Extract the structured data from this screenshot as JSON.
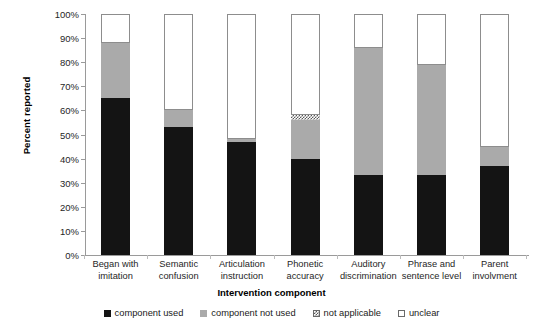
{
  "chart_data": {
    "type": "bar",
    "subtype": "stacked-bar-100-percent",
    "title": "",
    "xlabel": "Intervention component",
    "ylabel": "Percent reported",
    "ylim": [
      0,
      100
    ],
    "ytick_labels": [
      "0%",
      "10%",
      "20%",
      "30%",
      "40%",
      "50%",
      "60%",
      "70%",
      "80%",
      "90%",
      "100%"
    ],
    "ytick_values": [
      0,
      10,
      20,
      30,
      40,
      50,
      60,
      70,
      80,
      90,
      100
    ],
    "grid": false,
    "legend_position": "bottom",
    "categories": [
      "Began with imitation",
      "Semantic confusion",
      "Articulation instruction",
      "Phonetic accuracy",
      "Auditory discrimination",
      "Phrase and sentence level",
      "Parent involvment"
    ],
    "category_lines": [
      [
        "Began with",
        "imitation"
      ],
      [
        "Semantic",
        "confusion"
      ],
      [
        "Articulation",
        "instruction"
      ],
      [
        "Phonetic",
        "accuracy"
      ],
      [
        "Auditory",
        "discrimination"
      ],
      [
        "Phrase and",
        "sentence level"
      ],
      [
        "Parent",
        "involvment"
      ]
    ],
    "series": [
      {
        "name": "component used",
        "color": "#141414",
        "pattern": "solid",
        "values": [
          65,
          53,
          47,
          40,
          33,
          33,
          37
        ]
      },
      {
        "name": "component not used",
        "color": "#aaaaaa",
        "pattern": "solid",
        "values": [
          23,
          7,
          1,
          16,
          53,
          46,
          8
        ]
      },
      {
        "name": "not applicable",
        "color": "#ffffff",
        "pattern": "hatched",
        "values": [
          0,
          0,
          0,
          2,
          0,
          0,
          0
        ]
      },
      {
        "name": "unclear",
        "color": "#ffffff",
        "pattern": "outline",
        "values": [
          12,
          40,
          52,
          42,
          14,
          21,
          55
        ]
      }
    ],
    "cumulative_tops": {
      "component_used": [
        65,
        53,
        47,
        40,
        33,
        33,
        37
      ],
      "plus_component_not_used": [
        88,
        60,
        48,
        56,
        86,
        79,
        45
      ],
      "plus_not_applicable": [
        88,
        60,
        48,
        58,
        86,
        79,
        45
      ],
      "plus_unclear": [
        100,
        100,
        100,
        100,
        100,
        100,
        100
      ]
    }
  },
  "legend": {
    "items": [
      {
        "label": "component used",
        "swatch": "black-square-icon"
      },
      {
        "label": "component not used",
        "swatch": "gray-square-icon"
      },
      {
        "label": "not applicable",
        "swatch": "hatched-square-icon"
      },
      {
        "label": "unclear",
        "swatch": "white-square-icon"
      }
    ]
  }
}
